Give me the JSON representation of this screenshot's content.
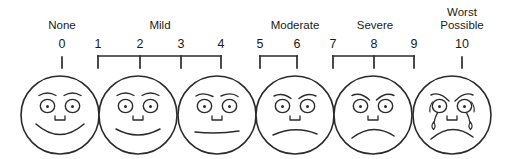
{
  "scale": {
    "title": "Pain Intensity Faces Scale",
    "colors": {
      "ink": "#1a1a1a",
      "stroke": "#2b2b2b",
      "background": "#ffffff"
    },
    "categories": [
      {
        "label": "None",
        "x": 62,
        "two_line": false
      },
      {
        "label": "Mild",
        "x": 160,
        "two_line": false
      },
      {
        "label": "Moderate",
        "x": 295,
        "two_line": false
      },
      {
        "label": "Severe",
        "x": 375,
        "two_line": false
      },
      {
        "label": "Worst\nPossible",
        "x": 462,
        "two_line": true
      }
    ],
    "numbers": [
      {
        "value": "0",
        "x": 62
      },
      {
        "value": "1",
        "x": 98
      },
      {
        "value": "2",
        "x": 140
      },
      {
        "value": "3",
        "x": 181
      },
      {
        "value": "4",
        "x": 221
      },
      {
        "value": "5",
        "x": 260
      },
      {
        "value": "6",
        "x": 297
      },
      {
        "value": "7",
        "x": 333
      },
      {
        "value": "8",
        "x": 374
      },
      {
        "value": "9",
        "x": 414
      },
      {
        "value": "10",
        "x": 462
      }
    ],
    "brackets": [
      {
        "name": "none-tick",
        "type": "tick",
        "x": 62,
        "ticks": [
          62
        ]
      },
      {
        "name": "mild-bracket",
        "type": "bracket",
        "x1": 98,
        "x2": 221,
        "ticks": [
          98,
          140,
          181,
          221
        ]
      },
      {
        "name": "moderate-bracket",
        "type": "bracket",
        "x1": 260,
        "x2": 297,
        "ticks": [
          260,
          297
        ]
      },
      {
        "name": "severe-bracket",
        "type": "bracket",
        "x1": 333,
        "x2": 414,
        "ticks": [
          333,
          374,
          414
        ]
      },
      {
        "name": "worst-tick",
        "type": "tick",
        "x": 462,
        "ticks": [
          462
        ]
      }
    ],
    "faces": [
      {
        "name": "face-none",
        "cx": 60,
        "cy": 115,
        "r": 39,
        "expression": "broad-smile",
        "tears": false
      },
      {
        "name": "face-mild",
        "cx": 138,
        "cy": 115,
        "r": 39,
        "expression": "smile",
        "tears": false
      },
      {
        "name": "face-moderate",
        "cx": 217,
        "cy": 115,
        "r": 39,
        "expression": "flat",
        "tears": false
      },
      {
        "name": "face-severe",
        "cx": 295,
        "cy": 115,
        "r": 39,
        "expression": "slight-frown",
        "tears": false
      },
      {
        "name": "face-very-severe",
        "cx": 373,
        "cy": 115,
        "r": 39,
        "expression": "frown",
        "tears": false
      },
      {
        "name": "face-worst",
        "cx": 452,
        "cy": 115,
        "r": 39,
        "expression": "deep-frown",
        "tears": true
      }
    ]
  }
}
